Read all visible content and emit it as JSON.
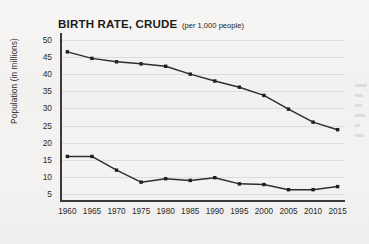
{
  "chart_data": {
    "type": "line",
    "title": "BIRTH RATE, CRUDE",
    "subtitle": "(per 1,000 people)",
    "xlabel": "",
    "ylabel": "Population (in millions)",
    "x": [
      1960,
      1965,
      1970,
      1975,
      1980,
      1985,
      1990,
      1995,
      2000,
      2005,
      2010,
      2015
    ],
    "xtick_labels": [
      "1960",
      "1965",
      "1970",
      "1975",
      "1980",
      "1985",
      "1990",
      "1995",
      "2000",
      "2005",
      "2010",
      "2015"
    ],
    "ytick_labels": [
      "5",
      "10",
      "15",
      "20",
      "25",
      "30",
      "35",
      "40",
      "45",
      "50"
    ],
    "yticks": [
      5,
      10,
      15,
      20,
      25,
      30,
      35,
      40,
      45,
      50
    ],
    "ylim": [
      3,
      52
    ],
    "xlim": [
      1958.5,
      2016.5
    ],
    "grid": "horizontal",
    "legend": "none",
    "line_color": "#2e2e2e",
    "marker_color": "#1f1f1f",
    "grid_color": "#dedddb",
    "axis_color": "#3a3a3a",
    "background_color": "#f4f3f1",
    "series": [
      {
        "name": "upper-series",
        "values": [
          46.5,
          44.6,
          43.6,
          43.0,
          42.3,
          40.0,
          38.0,
          36.2,
          33.8,
          29.8,
          26.0,
          23.8
        ]
      },
      {
        "name": "lower-series",
        "values": [
          16.0,
          16.0,
          12.0,
          8.5,
          9.5,
          9.0,
          9.8,
          8.0,
          7.8,
          6.3,
          6.3,
          7.2
        ]
      }
    ]
  },
  "margin_artifact": {
    "description": "faint-bleed-through-marks"
  }
}
